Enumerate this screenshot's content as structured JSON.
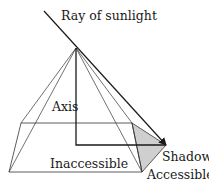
{
  "diagram": {
    "labels": {
      "ray": "Ray of sunlight",
      "axis": "Axis",
      "inaccessible": "Inaccessible",
      "shadow": "Shadow",
      "accessible": "Accessible"
    },
    "colors": {
      "line": "#1a1a1a",
      "thin_line": "#333333",
      "shadow_fill": "#cfcfcf",
      "background": "#ffffff"
    },
    "points": {
      "ray_start": [
        44,
        11
      ],
      "apex": [
        76,
        48
      ],
      "base_back_left": [
        21,
        123
      ],
      "base_back_right": [
        132,
        123
      ],
      "base_front_left": [
        9,
        172
      ],
      "base_front_right": [
        142,
        172
      ],
      "axis_foot": [
        76,
        145
      ],
      "shadow_tip": [
        166,
        145
      ]
    }
  }
}
